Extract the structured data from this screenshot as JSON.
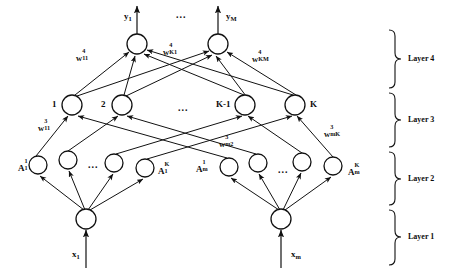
{
  "figure": {
    "type": "neural-network-architecture-diagram",
    "title": "",
    "background_color": "#ffffff",
    "stroke_color": "#111111"
  },
  "outputs": {
    "arrow_labels": [
      {
        "id": "y1",
        "base": "y",
        "sub": "1",
        "x": 124,
        "y": 12
      },
      {
        "id": "yM",
        "base": "y",
        "sub": "M",
        "x": 226,
        "y": 12
      }
    ],
    "ellipsis": {
      "text": "...",
      "x": 176,
      "y": 10
    }
  },
  "layer4": {
    "name": "Layer 4",
    "nodes": [
      {
        "id": "out-1",
        "cx": 137,
        "cy": 44,
        "r": 10
      },
      {
        "id": "out-M",
        "cx": 218,
        "cy": 44,
        "r": 10
      }
    ]
  },
  "layer3": {
    "name": "Layer 3",
    "nodes": [
      {
        "id": "h3-1",
        "label": "1",
        "cx": 72,
        "cy": 105,
        "r": 10
      },
      {
        "id": "h3-2",
        "label": "2",
        "cx": 122,
        "cy": 105,
        "r": 10
      },
      {
        "id": "h3-Km1",
        "label": "K-1",
        "cx": 245,
        "cy": 105,
        "r": 10
      },
      {
        "id": "h3-K",
        "label": "K",
        "cx": 295,
        "cy": 105,
        "r": 10
      }
    ],
    "node_labels": [
      {
        "text": "1",
        "x": 52,
        "y": 100
      },
      {
        "text": "2",
        "x": 101,
        "y": 100
      },
      {
        "text": "K-1",
        "x": 216,
        "y": 100
      },
      {
        "text": "K",
        "x": 310,
        "y": 100
      }
    ],
    "ellipsis": {
      "text": "...",
      "x": 178,
      "y": 103
    }
  },
  "layer2": {
    "name": "Layer 2",
    "groups": [
      {
        "id": "group-1",
        "nodes": [
          {
            "id": "a-1-1",
            "cx": 38,
            "cy": 165,
            "r": 9
          },
          {
            "id": "a-1-2",
            "cx": 68,
            "cy": 160,
            "r": 9
          },
          {
            "id": "a-1-3",
            "cx": 114,
            "cy": 163,
            "r": 9
          },
          {
            "id": "a-1-4",
            "cx": 145,
            "cy": 168,
            "r": 9
          }
        ],
        "ellipsis": {
          "text": "...",
          "x": 88,
          "y": 160
        },
        "left_label": {
          "base": "A",
          "sup": "1",
          "sub": "1",
          "x": 18,
          "y": 162
        },
        "right_label": {
          "base": "A",
          "sup": "K",
          "sub": "1",
          "x": 158,
          "y": 165
        }
      },
      {
        "id": "group-m",
        "nodes": [
          {
            "id": "a-m-1",
            "cx": 229,
            "cy": 167,
            "r": 9
          },
          {
            "id": "a-m-2",
            "cx": 258,
            "cy": 163,
            "r": 9
          },
          {
            "id": "a-m-3",
            "cx": 302,
            "cy": 162,
            "r": 9
          },
          {
            "id": "a-m-4",
            "cx": 333,
            "cy": 166,
            "r": 9
          }
        ],
        "ellipsis": {
          "text": "...",
          "x": 278,
          "y": 165
        },
        "left_label": {
          "base": "A",
          "sup": "1",
          "sub": "m",
          "x": 196,
          "y": 163
        },
        "right_label": {
          "base": "A",
          "sup": "K",
          "sub": "m",
          "x": 348,
          "y": 166
        }
      }
    ]
  },
  "layer1": {
    "name": "Layer 1",
    "nodes": [
      {
        "id": "in-1",
        "cx": 86,
        "cy": 219,
        "r": 10
      },
      {
        "id": "in-m",
        "cx": 281,
        "cy": 219,
        "r": 10
      }
    ],
    "input_labels": [
      {
        "base": "x",
        "sub": "1",
        "x": 72,
        "y": 250
      },
      {
        "base": "x",
        "sub": "m",
        "x": 291,
        "y": 250
      }
    ]
  },
  "weights": [
    {
      "id": "w4-11",
      "base": "w",
      "sup": "4",
      "sub": "11",
      "x": 76,
      "y": 52
    },
    {
      "id": "w4-K1",
      "base": "w",
      "sup": "4",
      "sub": "K1",
      "x": 163,
      "y": 46
    },
    {
      "id": "w4-KM",
      "base": "w",
      "sup": "4",
      "sub": "KM",
      "x": 252,
      "y": 53
    },
    {
      "id": "w3-11",
      "base": "w",
      "sup": "3",
      "sub": "11",
      "x": 38,
      "y": 122
    },
    {
      "id": "w3-m2",
      "base": "w",
      "sup": "3",
      "sub": "m2",
      "x": 219,
      "y": 138
    },
    {
      "id": "w3-mK",
      "base": "w",
      "sup": "3",
      "sub": "mK",
      "x": 324,
      "y": 128
    }
  ],
  "layer_brackets": [
    {
      "id": "bracket-layer4",
      "label": "Layer 4",
      "top": 30,
      "bottom": 88,
      "label_x": 408,
      "label_y": 55
    },
    {
      "id": "bracket-layer3",
      "label": "Layer 3",
      "top": 93,
      "bottom": 147,
      "label_x": 408,
      "label_y": 116
    },
    {
      "id": "bracket-layer2",
      "label": "Layer 2",
      "top": 152,
      "bottom": 205,
      "label_x": 408,
      "label_y": 175
    },
    {
      "id": "bracket-layer1",
      "label": "Layer 1",
      "top": 210,
      "bottom": 265,
      "label_x": 408,
      "label_y": 233
    }
  ]
}
